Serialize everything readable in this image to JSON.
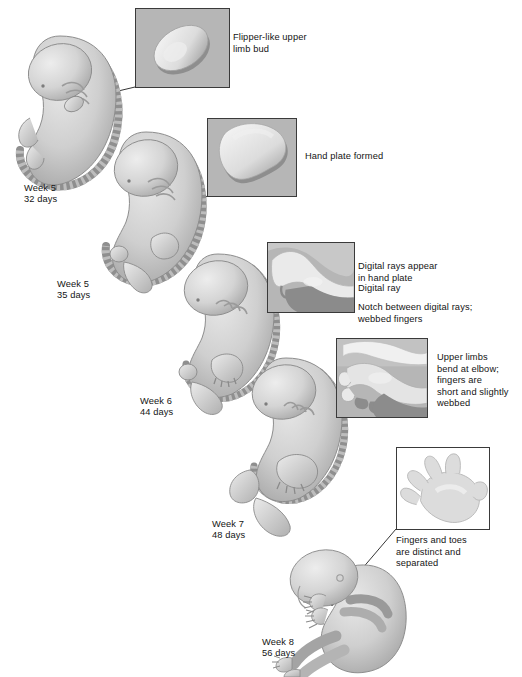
{
  "figure": {
    "caption_clipped": "",
    "background_color": "#ffffff",
    "text_color": "#141414",
    "inset_fill_gray": "#b6b6b6",
    "inset_border_color": "#3a3a3a",
    "embryo_base_color": "#c9c9c9",
    "embryo_shade_color": "#9a9a9a",
    "embryo_light_color": "#e3e3e3"
  },
  "stages": [
    {
      "id": "week5-32",
      "week": "Week 5",
      "days": "32 days",
      "label": "Week 5\n32 days"
    },
    {
      "id": "week5-35",
      "week": "Week 5",
      "days": "35 days",
      "label": "Week 5\n35 days"
    },
    {
      "id": "week6-44",
      "week": "Week 6",
      "days": "44 days",
      "label": "Week 6\n44 days"
    },
    {
      "id": "week7-48",
      "week": "Week 7",
      "days": "48 days",
      "label": "Week 7\n48 days"
    },
    {
      "id": "week8-56",
      "week": "Week 8",
      "days": "56 days",
      "label": "Week 8\n56 days"
    }
  ],
  "annotations": [
    {
      "id": "flipper-limb-bud",
      "text": "Flipper-like upper\nlimb bud"
    },
    {
      "id": "hand-plate-formed",
      "text": "Hand plate formed"
    },
    {
      "id": "digital-rays",
      "text": "Digital rays appear\nin hand plate"
    },
    {
      "id": "digital-ray",
      "text": "Digital ray"
    },
    {
      "id": "notch-webbed",
      "text": "Notch between digital rays;\nwebbed fingers"
    },
    {
      "id": "upper-limbs-bend",
      "text": "Upper limbs\nbend at elbow;\nfingers are\nshort and slightly\nwebbed"
    },
    {
      "id": "fingers-toes",
      "text": "Fingers and toes\nare distinct and\nseparated"
    }
  ],
  "insets": [
    {
      "id": "inset-limb-bud",
      "fill": "gray",
      "depicts": "flipper-like oval upper limb bud"
    },
    {
      "id": "inset-hand-plate",
      "fill": "gray",
      "depicts": "paddle-shaped hand plate"
    },
    {
      "id": "inset-digital-rays",
      "fill": "gray",
      "depicts": "hand plate with digital rays and notches"
    },
    {
      "id": "inset-bent-elbow",
      "fill": "gray",
      "depicts": "limb bent at elbow with short webbed fingers"
    },
    {
      "id": "inset-hand",
      "fill": "white",
      "depicts": "hand with five distinct separated fingers"
    }
  ]
}
